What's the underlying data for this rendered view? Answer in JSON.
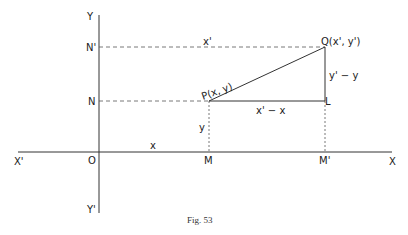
{
  "figure": {
    "caption": "Fig. 53",
    "axes": {
      "x_positive": "X",
      "x_negative": "X'",
      "y_positive": "Y",
      "y_negative": "Y'",
      "origin": "O"
    },
    "points": {
      "P": "P(x, y)",
      "Q": "Q(x', y')",
      "L": "L",
      "M": "M",
      "M_prime": "M'",
      "N": "N",
      "N_prime": "N'"
    },
    "segment_labels": {
      "OM": "x",
      "PM": "y",
      "N_prime_Q": "x'",
      "PL": "x' − x",
      "LQ": "y' − y"
    }
  }
}
